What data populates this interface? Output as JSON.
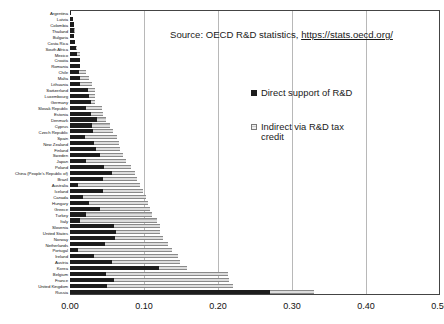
{
  "chart_data": {
    "type": "bar",
    "orientation": "horizontal",
    "stacked": true,
    "title": "",
    "subtitle": "",
    "xlabel": "",
    "ylabel": "",
    "xlim": [
      0.0,
      0.5
    ],
    "xticks": [
      "0.00",
      "0.10",
      "0.20",
      "0.30",
      "0.40",
      "0.50"
    ],
    "xtick_values": [
      0.0,
      0.1,
      0.2,
      0.3,
      0.4,
      0.5
    ],
    "grid": true,
    "grid_axis": "x",
    "legend_position": "inside-upper-right",
    "annotations": [
      "Source: OECD R&D statistics, https://stats.oecd.org/"
    ],
    "categories": [
      "Argentina",
      "Latvia",
      "Colombia",
      "Thailand",
      "Bulgaria",
      "Costa Rica",
      "South Africa",
      "Mexico",
      "Croatia",
      "Romania",
      "Chile",
      "Malta",
      "Lithuania",
      "Switzerland",
      "Luxembourg",
      "Germany",
      "Slovak Republic",
      "Estonia",
      "Denmark",
      "Cyprus",
      "Czech Republic",
      "Spain",
      "New Zealand",
      "Finland",
      "Sweden",
      "Japan",
      "Poland",
      "China (People's Republic of)",
      "Brazil",
      "Australia",
      "Iceland",
      "Canada",
      "Hungary",
      "Greece",
      "Turkey",
      "Italy",
      "Slovenia",
      "United States",
      "Norway",
      "Netherlands",
      "Portugal",
      "Ireland",
      "Austria",
      "Korea",
      "Belgium",
      "France",
      "United Kingdom",
      "Russia"
    ],
    "series": [
      {
        "name": "Direct support of R&D",
        "color": "#1d1d1d",
        "values": [
          0.002,
          0.004,
          0.005,
          0.005,
          0.006,
          0.007,
          0.008,
          0.009,
          0.013,
          0.013,
          0.012,
          0.013,
          0.014,
          0.024,
          0.026,
          0.028,
          0.021,
          0.028,
          0.036,
          0.03,
          0.031,
          0.02,
          0.032,
          0.035,
          0.04,
          0.022,
          0.046,
          0.057,
          0.044,
          0.011,
          0.044,
          0.018,
          0.026,
          0.04,
          0.021,
          0.014,
          0.059,
          0.062,
          0.061,
          0.047,
          0.011,
          0.032,
          0.057,
          0.12,
          0.048,
          0.06,
          0.05,
          0.27
        ]
      },
      {
        "name": "Indirect via R&D tax credit",
        "color": "#b4b4b4",
        "values": [
          0.0,
          0.0,
          0.0,
          0.001,
          0.0,
          0.0,
          0.002,
          0.004,
          0.0,
          0.0,
          0.009,
          0.013,
          0.016,
          0.01,
          0.008,
          0.006,
          0.022,
          0.016,
          0.013,
          0.024,
          0.027,
          0.043,
          0.034,
          0.033,
          0.031,
          0.054,
          0.036,
          0.031,
          0.047,
          0.083,
          0.055,
          0.085,
          0.08,
          0.068,
          0.09,
          0.104,
          0.063,
          0.06,
          0.065,
          0.085,
          0.127,
          0.114,
          0.091,
          0.038,
          0.165,
          0.155,
          0.17,
          0.06
        ]
      }
    ]
  },
  "source": {
    "prefix": "Source: OECD R&D statistics, ",
    "url_text": "https://stats.oecd.org/"
  },
  "legend": {
    "items": [
      {
        "label": "Direct support of R&D",
        "swatch": "direct"
      },
      {
        "label": "Indirect via R&D tax credit",
        "swatch": "indirect"
      }
    ]
  }
}
